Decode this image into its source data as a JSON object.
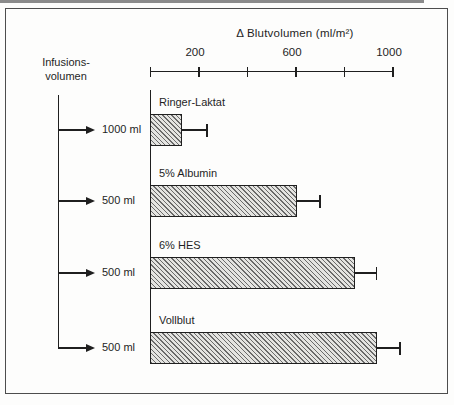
{
  "page": {
    "background": "#fdfdfc",
    "frame_color": "#4d4d4d",
    "ink_color": "#1f1f1f"
  },
  "chart_data": {
    "type": "bar",
    "orientation": "horizontal",
    "title": "Δ Blutvolumen (ml/m²)",
    "xlabel": "Δ Blutvolumen (ml/m²)",
    "ylabel": "Infusionsvolumen",
    "left_header_line1": "Infusions-",
    "left_header_line2": "volumen",
    "axis": {
      "min": 0,
      "max": 1000,
      "ticks": [
        0,
        200,
        400,
        600,
        800,
        1000
      ],
      "labeled_ticks": [
        200,
        600,
        1000
      ]
    },
    "bar_fill": "diagonal-hatch",
    "legend": "none",
    "grid": false,
    "bars": [
      {
        "label": "Ringer-Laktat",
        "infusion_volume": "1000 ml",
        "value": 130,
        "error_plus": 105
      },
      {
        "label": "5% Albumin",
        "infusion_volume": "500 ml",
        "value": 605,
        "error_plus": 95
      },
      {
        "label": "6% HES",
        "infusion_volume": "500 ml",
        "value": 845,
        "error_plus": 90
      },
      {
        "label": "Vollblut",
        "infusion_volume": "500 ml",
        "value": 935,
        "error_plus": 95
      }
    ]
  }
}
